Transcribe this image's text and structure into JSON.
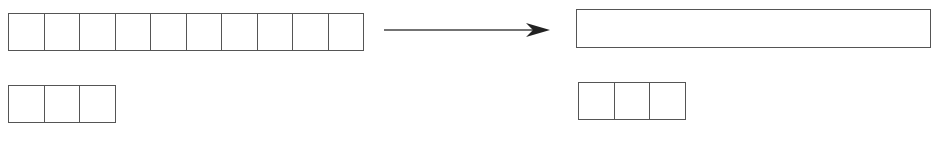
{
  "diagram": {
    "colors": {
      "stroke": "#555555",
      "arrow": "#222222",
      "background": "#ffffff"
    },
    "left": {
      "top_strip": {
        "cells": 10,
        "x": 8,
        "y": 13,
        "width": 356,
        "height": 38
      },
      "bottom_strip": {
        "cells": 3,
        "x": 8,
        "y": 85,
        "width": 108,
        "height": 38
      }
    },
    "arrow": {
      "x1": 384,
      "y1": 30,
      "x2": 550,
      "y2": 30,
      "direction": "right"
    },
    "right": {
      "top_bar": {
        "cells": 1,
        "x": 576,
        "y": 9,
        "width": 355,
        "height": 39
      },
      "bottom_strip": {
        "cells": 3,
        "x": 578,
        "y": 82,
        "width": 108,
        "height": 38
      }
    }
  }
}
